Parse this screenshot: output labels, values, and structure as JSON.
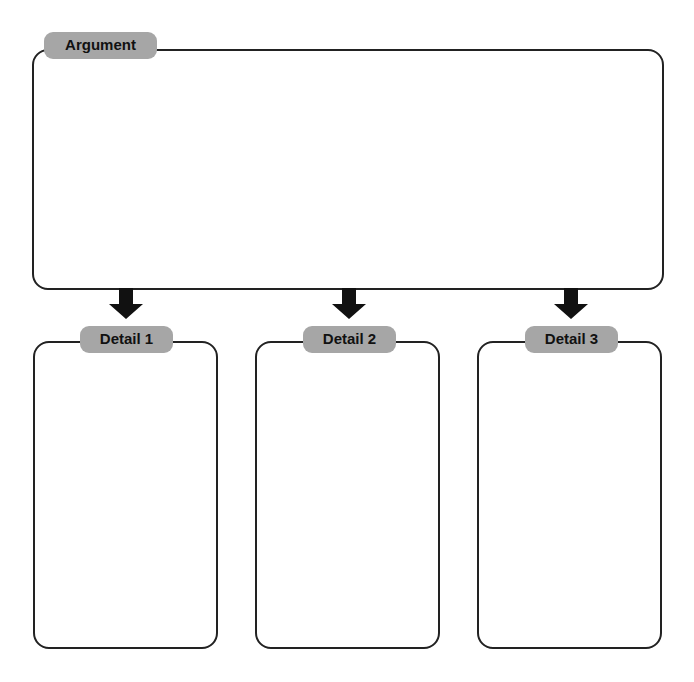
{
  "argument": {
    "label": "Argument"
  },
  "details": [
    {
      "label": "Detail 1"
    },
    {
      "label": "Detail 2"
    },
    {
      "label": "Detail 3"
    }
  ],
  "colors": {
    "label_fill": "#a6a6a6",
    "border": "#222222",
    "arrow": "#111111"
  }
}
